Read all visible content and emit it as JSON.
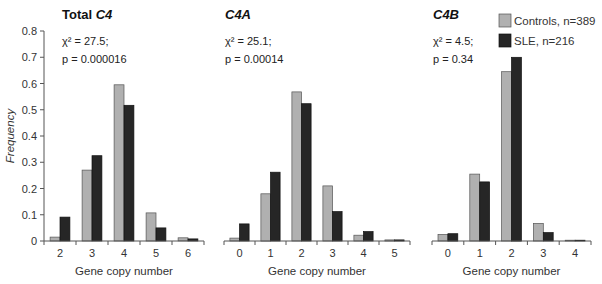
{
  "figure": {
    "y_axis_label": "Frequency",
    "x_axis_label": "Gene copy number",
    "legend": [
      {
        "label": "Controls, n=389",
        "color": "#b0b0b0"
      },
      {
        "label": "SLE, n=216",
        "color": "#262626"
      }
    ]
  },
  "chart_data": [
    {
      "type": "bar",
      "title": "Total C4",
      "title_plain": "Total ",
      "title_italic": "C4",
      "stat_chi": "χ² = 27.5;",
      "stat_p": "p = 0.000016",
      "xlabel": "Gene copy number",
      "ylabel": "Frequency",
      "ylim": [
        0,
        0.8
      ],
      "yticks": [
        "0",
        "0.1",
        "0.2",
        "0.3",
        "0.4",
        "0.5",
        "0.6",
        "0.7",
        "0.8"
      ],
      "categories": [
        "2",
        "3",
        "4",
        "5",
        "6"
      ],
      "series": [
        {
          "name": "Controls, n=389",
          "values": [
            0.015,
            0.27,
            0.595,
            0.107,
            0.012
          ]
        },
        {
          "name": "SLE, n=216",
          "values": [
            0.091,
            0.325,
            0.517,
            0.05,
            0.008
          ]
        }
      ]
    },
    {
      "type": "bar",
      "title": "C4A",
      "title_plain": "",
      "title_italic": "C4A",
      "stat_chi": "χ² = 25.1;",
      "stat_p": "p = 0.00014",
      "xlabel": "Gene copy number",
      "ylabel": "Frequency",
      "ylim": [
        0,
        0.8
      ],
      "categories": [
        "0",
        "1",
        "2",
        "3",
        "4",
        "5"
      ],
      "series": [
        {
          "name": "Controls, n=389",
          "values": [
            0.011,
            0.18,
            0.568,
            0.21,
            0.022,
            0.004
          ]
        },
        {
          "name": "SLE, n=216",
          "values": [
            0.065,
            0.262,
            0.523,
            0.112,
            0.036,
            0.004
          ]
        }
      ]
    },
    {
      "type": "bar",
      "title": "C4B",
      "title_plain": "",
      "title_italic": "C4B",
      "stat_chi": "χ² = 4.5;",
      "stat_p": "p = 0.34",
      "xlabel": "Gene copy number",
      "ylabel": "Frequency",
      "ylim": [
        0,
        0.8
      ],
      "categories": [
        "0",
        "1",
        "2",
        "3",
        "4"
      ],
      "series": [
        {
          "name": "Controls, n=389",
          "values": [
            0.025,
            0.255,
            0.645,
            0.067,
            0.003
          ]
        },
        {
          "name": "SLE, n=216",
          "values": [
            0.028,
            0.225,
            0.7,
            0.032,
            0.003
          ]
        }
      ]
    }
  ]
}
